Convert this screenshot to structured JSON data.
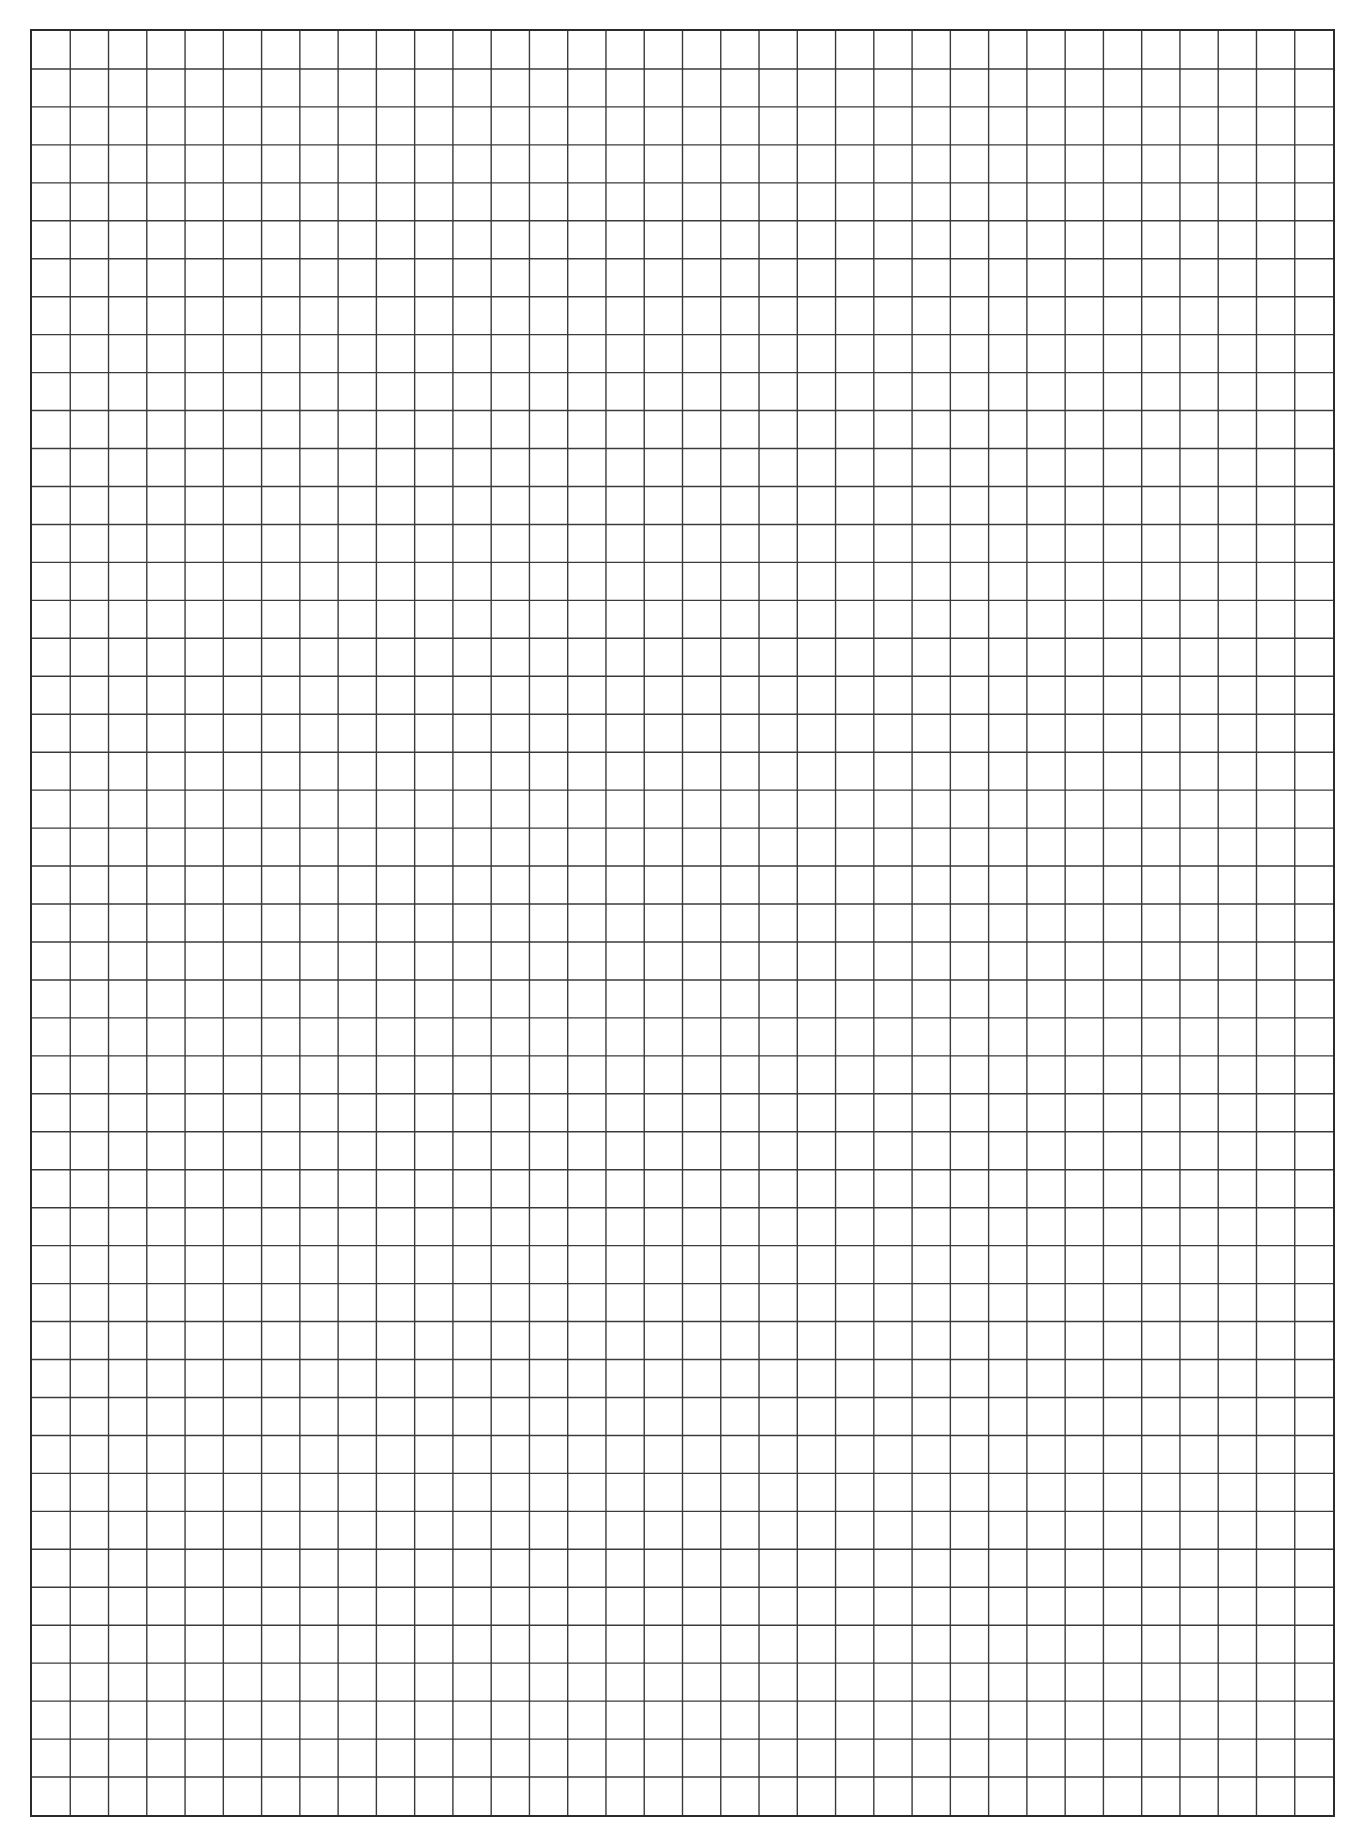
{
  "page": {
    "type": "graph-paper",
    "background_color": "#ffffff",
    "line_color": "#3a3a3a",
    "border_color": "#2b2b2b"
  },
  "grid": {
    "left": 30,
    "top": 29,
    "width": 1305,
    "height": 1788,
    "columns": 34,
    "rows": 47,
    "line_width": 1.4,
    "border_width": 2
  }
}
